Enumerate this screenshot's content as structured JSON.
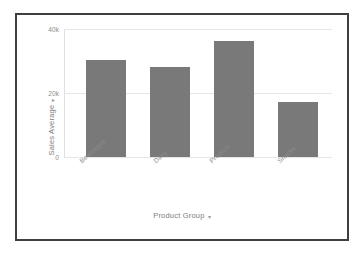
{
  "chart_data": {
    "type": "bar",
    "title": "",
    "categories": [
      "Beverages",
      "Dairy",
      "Produce",
      "Snacks"
    ],
    "values": [
      30400,
      28200,
      36400,
      17100
    ],
    "xlabel": "Product Group",
    "ylabel": "Sales Average",
    "ylim": [
      0,
      40000
    ],
    "yticks": [
      0,
      20000,
      40000
    ],
    "ytick_labels": [
      "0",
      "20k",
      "40k"
    ],
    "grid": true,
    "legend": false,
    "bar_color": "#797979",
    "gridline_color": "#e6e6e6",
    "axis_text_color": "#8a8a8a",
    "frame_border_color": "#3f3f3f",
    "background_color": "#ffffff"
  },
  "axes": {
    "y_title": "Sales Average",
    "y_title_caret": "▾",
    "x_title": "Product Group",
    "x_title_caret": "▾",
    "y_tick_0": "0",
    "y_tick_1": "20k",
    "y_tick_2": "40k"
  },
  "bars": [
    {
      "label": "Beverages",
      "value": 30400
    },
    {
      "label": "Dairy",
      "value": 28200
    },
    {
      "label": "Produce",
      "value": 36400
    },
    {
      "label": "Snacks",
      "value": 17100
    }
  ]
}
